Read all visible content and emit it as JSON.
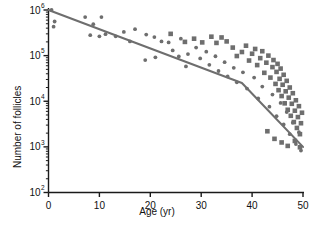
{
  "chart_data": {
    "type": "scatter",
    "title": "",
    "xlabel": "Age (yr)",
    "ylabel": "Number of follicles",
    "xlim": [
      0,
      50
    ],
    "ylim": [
      100,
      1000000
    ],
    "yscale": "log",
    "xscale": "linear",
    "grid": false,
    "legend": null,
    "xticks": [
      0,
      10,
      20,
      30,
      40,
      50
    ],
    "xtick_labels": [
      "0",
      "10",
      "20",
      "30",
      "40",
      "50"
    ],
    "yticks": [
      100,
      1000,
      10000,
      100000,
      1000000
    ],
    "ytick_labels": [
      "10",
      "10",
      "10",
      "10",
      "10"
    ],
    "ytick_exponents": [
      "2",
      "3",
      "4",
      "5",
      "6"
    ],
    "y_minor_ticks": true,
    "marker_color": "#6e6e6e",
    "line_color": "#6e6e6e",
    "axis_color": "#1a1a1a",
    "series": [
      {
        "name": "circles",
        "marker": "circle",
        "points": [
          [
            0.6,
            1000000
          ],
          [
            1.2,
            560000
          ],
          [
            1.0,
            430000
          ],
          [
            7.2,
            700000
          ],
          [
            8.8,
            490000
          ],
          [
            10.4,
            700000
          ],
          [
            8.2,
            280000
          ],
          [
            10.0,
            265000
          ],
          [
            11.2,
            295000
          ],
          [
            13.2,
            265000
          ],
          [
            14.8,
            330000
          ],
          [
            17.0,
            380000
          ],
          [
            16.0,
            205000
          ],
          [
            19.2,
            290000
          ],
          [
            20.8,
            255000
          ],
          [
            19.0,
            80000
          ],
          [
            22.2,
            205000
          ],
          [
            21.0,
            92000
          ],
          [
            23.6,
            195000
          ],
          [
            24.4,
            130000
          ],
          [
            25.6,
            96000
          ],
          [
            26.0,
            235000
          ],
          [
            27.4,
            108000
          ],
          [
            27.0,
            58000
          ],
          [
            29.0,
            150000
          ],
          [
            29.8,
            87000
          ],
          [
            31.0,
            122000
          ],
          [
            31.6,
            63000
          ],
          [
            32.8,
            97000
          ],
          [
            33.4,
            46000
          ],
          [
            34.6,
            72000
          ],
          [
            35.2,
            35000
          ],
          [
            36.4,
            54000
          ],
          [
            37.0,
            26000
          ],
          [
            38.2,
            43000
          ],
          [
            39.0,
            19000
          ],
          [
            40.4,
            33000
          ],
          [
            41.2,
            11500
          ],
          [
            42.0,
            21000
          ],
          [
            43.4,
            7600
          ],
          [
            44.0,
            14000
          ],
          [
            44.8,
            4700
          ],
          [
            45.6,
            9200
          ],
          [
            46.2,
            3100
          ],
          [
            46.8,
            5800
          ],
          [
            47.4,
            1900
          ],
          [
            48.0,
            3400
          ],
          [
            48.6,
            1150
          ],
          [
            49.2,
            2100
          ],
          [
            49.6,
            830
          ]
        ]
      },
      {
        "name": "squares",
        "marker": "square",
        "points": [
          [
            33.0,
            190000
          ],
          [
            35.0,
            205000
          ],
          [
            36.2,
            150000
          ],
          [
            37.0,
            98000
          ],
          [
            38.0,
            120000
          ],
          [
            38.8,
            165000
          ],
          [
            39.4,
            78000
          ],
          [
            40.0,
            110000
          ],
          [
            40.6,
            140000
          ],
          [
            41.0,
            62000
          ],
          [
            41.6,
            88000
          ],
          [
            42.0,
            125000
          ],
          [
            42.4,
            42000
          ],
          [
            42.8,
            70000
          ],
          [
            43.2,
            100000
          ],
          [
            43.6,
            33000
          ],
          [
            44.0,
            56000
          ],
          [
            44.2,
            80000
          ],
          [
            44.6,
            24000
          ],
          [
            44.8,
            44000
          ],
          [
            45.0,
            66000
          ],
          [
            45.2,
            17500
          ],
          [
            45.4,
            31000
          ],
          [
            45.6,
            52000
          ],
          [
            45.8,
            13000
          ],
          [
            46.0,
            23000
          ],
          [
            46.2,
            38000
          ],
          [
            46.4,
            9000
          ],
          [
            46.6,
            16500
          ],
          [
            46.8,
            28000
          ],
          [
            47.0,
            6500
          ],
          [
            47.2,
            12000
          ],
          [
            47.4,
            20000
          ],
          [
            47.6,
            4800
          ],
          [
            47.8,
            8800
          ],
          [
            48.0,
            15000
          ],
          [
            48.2,
            3500
          ],
          [
            48.4,
            6200
          ],
          [
            48.6,
            10500
          ],
          [
            48.8,
            2600
          ],
          [
            49.0,
            4500
          ],
          [
            49.2,
            7800
          ],
          [
            49.4,
            1900
          ],
          [
            49.6,
            3300
          ],
          [
            49.8,
            5600
          ],
          [
            32.0,
            260000
          ],
          [
            34.0,
            250000
          ],
          [
            30.2,
            195000
          ],
          [
            28.6,
            235000
          ],
          [
            26.8,
            200000
          ],
          [
            24.0,
            300000
          ],
          [
            43.0,
            2200
          ],
          [
            44.4,
            1500
          ],
          [
            45.8,
            1250
          ],
          [
            47.0,
            1050
          ],
          [
            48.4,
            1350
          ],
          [
            49.4,
            980
          ]
        ]
      }
    ],
    "trend_line": {
      "name": "fitted-biphasic-decline",
      "segments": [
        {
          "from": [
            0.0,
            1000000
          ],
          "to": [
            38.0,
            25000
          ]
        },
        {
          "from": [
            38.0,
            25000
          ],
          "to": [
            50.0,
            1000
          ]
        }
      ]
    }
  }
}
